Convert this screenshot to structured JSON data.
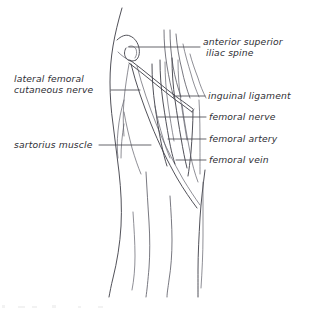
{
  "figure": {
    "style": "hand-drawn line illustration",
    "ink_color": "#3d3d46",
    "background_color": "#ffffff",
    "label_text_color": "#2e2e34"
  },
  "labels": {
    "asis": {
      "line1": "anterior superior",
      "line2": "iliac spine",
      "side": "right"
    },
    "inguinal_ligament": {
      "line1": "inguinal ligament",
      "side": "right"
    },
    "femoral_nerve": {
      "line1": "femoral nerve",
      "side": "right"
    },
    "femoral_artery": {
      "line1": "femoral artery",
      "side": "right"
    },
    "femoral_vein": {
      "line1": "femoral vein",
      "side": "right"
    },
    "lateral_femoral_cutaneous_nerve": {
      "line1": "lateral femoral",
      "line2": "cutaneous nerve",
      "side": "left"
    },
    "sartorius_muscle": {
      "line1": "sartorius muscle",
      "side": "left"
    }
  }
}
